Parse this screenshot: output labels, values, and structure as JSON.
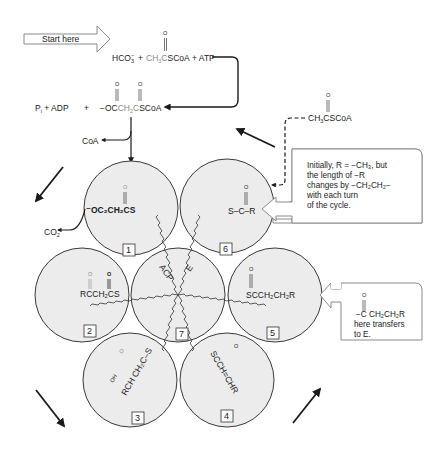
{
  "start": {
    "label": "Start here"
  },
  "reaction1": {
    "hco3": "HCO",
    "hco3_sub": "3",
    "hco3_sup": "−",
    "plus1": "+",
    "acetyl": "CH",
    "acetyl_sub": "3",
    "acetyl_c": "C",
    "acetyl_scoa": "SCoA",
    "carbonyl_o": "O",
    "plus2": "+ ATP"
  },
  "reaction2": {
    "pi_adp": "P",
    "pi_sub": "i",
    "pi_rest": " + ADP",
    "plus": "+",
    "malonyl_prefix": "−OC",
    "malonyl_ch2": "CH",
    "malonyl_ch2_sub": "2",
    "malonyl_c": "C",
    "malonyl_scoa": "SCoA",
    "o1": "O",
    "o2": "O"
  },
  "coa_release": "CoA",
  "co2_release": {
    "text": "CO",
    "sub": "2"
  },
  "acetyl_input": {
    "o": "O",
    "text": "CH",
    "sub": "3",
    "rest": "CSCoA"
  },
  "note_r": {
    "lines": [
      "Initially, R = −CH₃, but",
      "the length of −R",
      "changes by −CH₂CH₂−",
      "with each turn",
      "of the cycle."
    ]
  },
  "note_transfer": {
    "o": "O",
    "formula": "−C CH₂CH₂R",
    "lines": [
      "here transfers",
      "to E."
    ]
  },
  "subunits": [
    {
      "id": "1",
      "label": "1",
      "formula": "⁻OC₂CH₂CS",
      "o": "O"
    },
    {
      "id": "2",
      "label": "2",
      "formula": "RCCH₂CS",
      "o1": "O",
      "o2": "O"
    },
    {
      "id": "3",
      "label": "3",
      "formula": "RCH CH₂C–S",
      "oh": "OH",
      "o": "O"
    },
    {
      "id": "4",
      "label": "4",
      "formula": "SCCH=CHR",
      "o": "O"
    },
    {
      "id": "5",
      "label": "5",
      "formula": "SCCH₂CH₂R",
      "o": "O"
    },
    {
      "id": "6",
      "label": "6",
      "formula": "S–C–R",
      "o": "O"
    },
    {
      "id": "7",
      "label": "7",
      "acp": "ACP",
      "e": "E"
    }
  ],
  "colors": {
    "circle_fill": "#ececec",
    "circle_stroke": "#3a3a3a",
    "gray_text": "#8a8a8a",
    "ink": "#1a1a1a"
  }
}
